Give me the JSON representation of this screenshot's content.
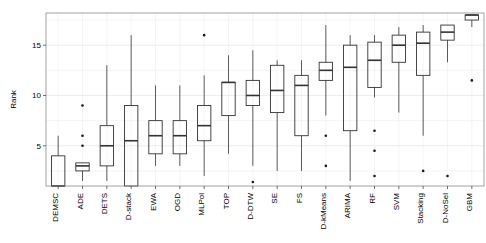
{
  "chart_data": {
    "type": "box",
    "title": "",
    "xlabel": "",
    "ylabel": "Rank",
    "ylim": [
      1,
      18.2
    ],
    "yticks": [
      5,
      10,
      15
    ],
    "ytick_labels": [
      "5",
      "10",
      "15"
    ],
    "grid": true,
    "legend": "none",
    "categories": [
      "DEMSC",
      "ADE",
      "DETS",
      "D-stack",
      "EWA",
      "OGD",
      "MLPol",
      "TOP",
      "D-DTW",
      "SE",
      "FS",
      "D-kMeans",
      "ARIMA",
      "RF",
      "SVM",
      "Stacking",
      "D-NoSel",
      "GBM"
    ],
    "boxes": [
      {
        "name": "DEMSC",
        "min": 1.0,
        "q1": 1.0,
        "median": 1.0,
        "q3": 4.0,
        "max": 6.0,
        "outliers": []
      },
      {
        "name": "ADE",
        "min": 1.5,
        "q1": 2.5,
        "median": 3.0,
        "q3": 3.3,
        "max": 3.3,
        "outliers": [
          5.0,
          6.0,
          9.0
        ]
      },
      {
        "name": "DETS",
        "min": 1.5,
        "q1": 3.0,
        "median": 5.0,
        "q3": 7.0,
        "max": 13.0,
        "outliers": []
      },
      {
        "name": "D-stack",
        "min": 1.0,
        "q1": 1.0,
        "median": 5.5,
        "q3": 9.0,
        "max": 16.0,
        "outliers": []
      },
      {
        "name": "EWA",
        "min": 3.0,
        "q1": 4.2,
        "median": 6.0,
        "q3": 7.5,
        "max": 11.0,
        "outliers": []
      },
      {
        "name": "OGD",
        "min": 3.0,
        "q1": 4.2,
        "median": 6.0,
        "q3": 7.5,
        "max": 11.0,
        "outliers": []
      },
      {
        "name": "MLPol",
        "min": 2.0,
        "q1": 5.5,
        "median": 7.0,
        "q3": 9.0,
        "max": 12.0,
        "outliers": [
          16.0
        ]
      },
      {
        "name": "TOP",
        "min": 4.2,
        "q1": 8.0,
        "median": 11.3,
        "q3": 11.3,
        "max": 14.0,
        "outliers": []
      },
      {
        "name": "D-DTW",
        "min": 3.0,
        "q1": 9.0,
        "median": 10.0,
        "q3": 11.5,
        "max": 14.5,
        "outliers": [
          1.4
        ]
      },
      {
        "name": "SE",
        "min": 2.5,
        "q1": 8.3,
        "median": 10.5,
        "q3": 13.0,
        "max": 13.5,
        "outliers": []
      },
      {
        "name": "FS",
        "min": 2.5,
        "q1": 6.0,
        "median": 11.0,
        "q3": 12.0,
        "max": 13.5,
        "outliers": []
      },
      {
        "name": "D-kMeans",
        "min": 8.0,
        "q1": 11.5,
        "median": 12.5,
        "q3": 13.3,
        "max": 17.0,
        "outliers": [
          3.0,
          6.0
        ]
      },
      {
        "name": "ARIMA",
        "min": 1.5,
        "q1": 6.5,
        "median": 12.8,
        "q3": 15.0,
        "max": 16.0,
        "outliers": []
      },
      {
        "name": "RF",
        "min": 9.8,
        "q1": 10.8,
        "median": 13.5,
        "q3": 15.3,
        "max": 16.0,
        "outliers": [
          2.0,
          4.5,
          6.5
        ]
      },
      {
        "name": "SVM",
        "min": 8.3,
        "q1": 13.3,
        "median": 15.0,
        "q3": 16.0,
        "max": 16.8,
        "outliers": []
      },
      {
        "name": "Stacking",
        "min": 6.0,
        "q1": 12.0,
        "median": 15.2,
        "q3": 16.3,
        "max": 17.0,
        "outliers": [
          2.5
        ]
      },
      {
        "name": "D-NoSel",
        "min": 13.3,
        "q1": 15.5,
        "median": 16.3,
        "q3": 17.0,
        "max": 17.0,
        "outliers": [
          2.0
        ]
      },
      {
        "name": "GBM",
        "min": 16.8,
        "q1": 17.5,
        "median": 18.0,
        "q3": 18.0,
        "max": 18.0,
        "outliers": [
          11.5
        ]
      }
    ]
  },
  "axis": {
    "y_title": "Rank"
  },
  "style": {
    "line_color": "#333333",
    "grid_color": "#ebebeb",
    "frame_color": "#8c8c8c",
    "background": "#ffffff"
  }
}
